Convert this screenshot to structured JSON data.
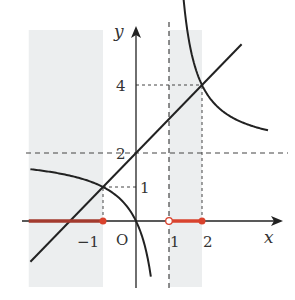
{
  "chart_data": {
    "type": "line",
    "title": "",
    "xlabel": "x",
    "ylabel": "y",
    "origin_label": "O",
    "xlim": [
      -3.25,
      4.3
    ],
    "ylim": [
      -1.95,
      5.5
    ],
    "x_ticks": [
      {
        "value": -1,
        "label": "−1"
      },
      {
        "value": 1,
        "label": "1"
      },
      {
        "value": 2,
        "label": "2"
      }
    ],
    "y_ticks": [
      {
        "value": 1,
        "label": "1"
      },
      {
        "value": 2,
        "label": "2"
      },
      {
        "value": 4,
        "label": "4"
      }
    ],
    "series": [
      {
        "name": "y = x + 2",
        "kind": "line",
        "slope": 1,
        "intercept": 2,
        "x_range": [
          -3.2,
          3.2
        ],
        "color": "#222222"
      },
      {
        "name": "y = 2x/(x-1)",
        "kind": "hyperbola",
        "asymptote_x": 1,
        "asymptote_y": 2,
        "branches": [
          [
            -3.2,
            0.45
          ],
          [
            1.28,
            4.0
          ]
        ],
        "color": "#222222"
      }
    ],
    "asymptotes": [
      {
        "type": "vertical",
        "value": 1
      },
      {
        "type": "horizontal",
        "value": 2
      }
    ],
    "guides": [
      {
        "from": [
          -1,
          0
        ],
        "to": [
          -1,
          1
        ]
      },
      {
        "from": [
          -1,
          1
        ],
        "to": [
          0,
          1
        ]
      },
      {
        "from": [
          2,
          0
        ],
        "to": [
          2,
          4
        ]
      },
      {
        "from": [
          0,
          4
        ],
        "to": [
          2,
          4
        ]
      }
    ],
    "shaded_regions": [
      {
        "x_from": -3.25,
        "x_to": -1
      },
      {
        "x_from": 1,
        "x_to": 2
      }
    ],
    "solution_intervals": [
      {
        "from": -3.25,
        "to": -1,
        "left_closed": false,
        "right_closed": true
      },
      {
        "from": 1,
        "to": 2,
        "left_closed": false,
        "right_closed": true
      }
    ],
    "colors": {
      "shade": "#eceeef",
      "solution": "#d9432e",
      "solution_dark": "#a33a2e",
      "axis": "#222222",
      "dash": "#444444"
    }
  }
}
